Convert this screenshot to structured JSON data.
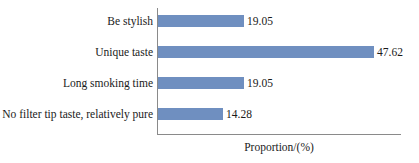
{
  "chart_data": {
    "type": "bar",
    "orientation": "horizontal",
    "title": "",
    "xlabel": "Proportion/(%)",
    "ylabel": "",
    "categories": [
      "Be stylish",
      "Unique taste",
      "Long smoking time",
      "No filter tip taste, relatively pure"
    ],
    "values": [
      19.05,
      47.62,
      19.05,
      14.28
    ],
    "value_labels": [
      "19.05",
      "47.62",
      "19.05",
      "14.28"
    ],
    "xlim": [
      0,
      53.6
    ],
    "grid": false,
    "legend": null,
    "bar_color": "#6f8fc0",
    "axis_color": "#8a8a8a",
    "text_color": "#1a1a1a"
  },
  "axis": {
    "x_title": "Proportion/(%)"
  },
  "bars": [
    {
      "category": "Be stylish",
      "value": 19.05,
      "label": "19.05"
    },
    {
      "category": "Unique taste",
      "value": 47.62,
      "label": "47.62"
    },
    {
      "category": "Long smoking time",
      "value": 19.05,
      "label": "19.05"
    },
    {
      "category": "No filter tip taste, relatively pure",
      "value": 14.28,
      "label": "14.28"
    }
  ]
}
